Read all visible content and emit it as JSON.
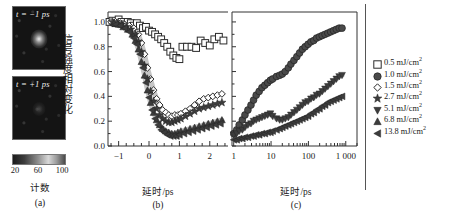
{
  "figure": {
    "panel_a": {
      "label": "(a)",
      "image_top_label": "t = −1 ps",
      "image_bottom_label": "t = +1 ps",
      "colorbar_title": "计数",
      "colorbar_ticks": [
        "20",
        "60",
        "100"
      ],
      "colorbar_min": 20,
      "colorbar_max": 100
    },
    "y_axis_label": "信号强度相对变化",
    "legend_title": "",
    "legend": [
      {
        "marker": "open-square-icon",
        "label": "0.5 mJ/cm",
        "sup": "2",
        "value": 0.5
      },
      {
        "marker": "filled-circle-icon",
        "label": "1.0 mJ/cm",
        "sup": "2",
        "value": 1.0
      },
      {
        "marker": "open-diamond-icon",
        "label": "1.5 mJ/cm",
        "sup": "2",
        "value": 1.5
      },
      {
        "marker": "filled-star-icon",
        "label": "2.7 mJ/cm",
        "sup": "2",
        "value": 2.7
      },
      {
        "marker": "filled-down-triangle-icon",
        "label": "5.1 mJ/cm",
        "sup": "2",
        "value": 5.1
      },
      {
        "marker": "filled-up-triangle-icon",
        "label": "6.8 mJ/cm",
        "sup": "2",
        "value": 6.8
      },
      {
        "marker": "filled-left-triangle-icon",
        "label": "13.8 mJ/cm",
        "sup": "2",
        "value": 13.8
      }
    ]
  },
  "chart_data": [
    {
      "type": "scatter",
      "panel": "(b)",
      "title": "",
      "xlabel": "延时/ps",
      "ylabel": "信号强度相对变化",
      "xscale": "linear",
      "xlim": [
        -1.35,
        2.6
      ],
      "ylim": [
        0.0,
        1.08
      ],
      "xticks": [
        -1,
        0,
        1,
        2
      ],
      "xticklabels": [
        "−1",
        "0",
        "1",
        "2"
      ],
      "yticks": [
        0.0,
        0.2,
        0.4,
        0.6,
        0.8,
        1.0
      ],
      "yticklabels": [
        "0.0",
        "0.2",
        "0.4",
        "0.6",
        "0.8",
        "1.0"
      ],
      "grid": false,
      "legend_position": "right-outside",
      "series": [
        {
          "name": "0.5 mJ/cm2",
          "marker": "open-square-icon",
          "x": [
            -1.3,
            -1.2,
            -1.1,
            -1.0,
            -0.9,
            -0.8,
            -0.7,
            -0.6,
            -0.5,
            -0.4,
            -0.3,
            -0.2,
            -0.1,
            0.0,
            0.1,
            0.2,
            0.3,
            0.4,
            0.5,
            0.6,
            0.7,
            0.8,
            0.9,
            1.0,
            1.1,
            1.25,
            1.4,
            1.55,
            1.7,
            1.85,
            2.0,
            2.15,
            2.3,
            2.45
          ],
          "y": [
            1.0,
            1.01,
            0.99,
            1.02,
            1.0,
            0.98,
            1.0,
            0.99,
            0.97,
            0.99,
            0.97,
            0.95,
            0.96,
            0.93,
            0.92,
            0.9,
            0.88,
            0.86,
            0.83,
            0.8,
            0.76,
            0.73,
            0.71,
            0.7,
            0.8,
            0.8,
            0.8,
            0.79,
            0.85,
            0.83,
            0.81,
            0.86,
            0.88,
            0.85
          ]
        },
        {
          "name": "1.5 mJ/cm2",
          "marker": "open-diamond-icon",
          "x": [
            -1.25,
            -1.1,
            -0.95,
            -0.8,
            -0.65,
            -0.5,
            -0.35,
            -0.25,
            -0.15,
            -0.05,
            0.05,
            0.15,
            0.25,
            0.35,
            0.45,
            0.55,
            0.65,
            0.75,
            0.85,
            0.95,
            1.05,
            1.2,
            1.35,
            1.5,
            1.65,
            1.8,
            1.95,
            2.1,
            2.25,
            2.4
          ],
          "y": [
            1.0,
            1.0,
            0.99,
            0.98,
            0.97,
            0.95,
            0.9,
            0.83,
            0.74,
            0.63,
            0.54,
            0.45,
            0.38,
            0.33,
            0.29,
            0.27,
            0.25,
            0.24,
            0.25,
            0.25,
            0.26,
            0.28,
            0.3,
            0.33,
            0.36,
            0.38,
            0.39,
            0.4,
            0.41,
            0.42
          ]
        },
        {
          "name": "2.7 mJ/cm2",
          "marker": "filled-star-icon",
          "x": [
            -1.2,
            -1.05,
            -0.9,
            -0.75,
            -0.6,
            -0.45,
            -0.35,
            -0.25,
            -0.15,
            -0.05,
            0.05,
            0.15,
            0.25,
            0.35,
            0.45,
            0.55,
            0.65,
            0.75,
            0.85,
            0.95,
            1.05,
            1.2,
            1.35,
            1.5,
            1.65,
            1.8,
            1.95,
            2.1,
            2.25,
            2.4
          ],
          "y": [
            1.0,
            0.99,
            0.98,
            0.96,
            0.94,
            0.9,
            0.84,
            0.76,
            0.65,
            0.54,
            0.44,
            0.36,
            0.3,
            0.25,
            0.22,
            0.2,
            0.19,
            0.19,
            0.2,
            0.21,
            0.22,
            0.24,
            0.26,
            0.28,
            0.3,
            0.31,
            0.32,
            0.33,
            0.34,
            0.35
          ]
        },
        {
          "name": "6.8 mJ/cm2",
          "marker": "filled-up-triangle-icon",
          "x": [
            -1.15,
            -1.0,
            -0.85,
            -0.7,
            -0.55,
            -0.45,
            -0.35,
            -0.25,
            -0.15,
            -0.05,
            0.05,
            0.15,
            0.25,
            0.35,
            0.45,
            0.55,
            0.65,
            0.75,
            0.85,
            0.95,
            1.05,
            1.2,
            1.35,
            1.5,
            1.65,
            1.8,
            1.95,
            2.1,
            2.25,
            2.4
          ],
          "y": [
            0.99,
            0.98,
            0.96,
            0.94,
            0.9,
            0.85,
            0.78,
            0.68,
            0.57,
            0.45,
            0.35,
            0.27,
            0.21,
            0.17,
            0.14,
            0.12,
            0.11,
            0.1,
            0.1,
            0.11,
            0.12,
            0.13,
            0.14,
            0.15,
            0.16,
            0.17,
            0.18,
            0.19,
            0.2,
            0.21
          ]
        },
        {
          "name": "13.8 mJ/cm2",
          "marker": "filled-left-triangle-icon",
          "x": [
            -1.1,
            -0.95,
            -0.8,
            -0.65,
            -0.5,
            -0.4,
            -0.3,
            -0.2,
            -0.1,
            0.0,
            0.1,
            0.2,
            0.3,
            0.4,
            0.5,
            0.6,
            0.7,
            0.8,
            0.9,
            1.0,
            1.15,
            1.3,
            1.45,
            1.6,
            1.75,
            1.9,
            2.05,
            2.2,
            2.35
          ],
          "y": [
            0.98,
            0.97,
            0.95,
            0.92,
            0.87,
            0.82,
            0.74,
            0.63,
            0.51,
            0.39,
            0.29,
            0.22,
            0.17,
            0.13,
            0.11,
            0.09,
            0.08,
            0.08,
            0.08,
            0.09,
            0.1,
            0.11,
            0.12,
            0.13,
            0.14,
            0.15,
            0.16,
            0.17,
            0.18
          ]
        }
      ],
      "fit_curves": [
        {
          "name": "fast-decay-guide-1",
          "note": "grey band through diamond/star decay"
        },
        {
          "name": "fast-decay-guide-2",
          "note": "grey band through triangle decay"
        }
      ]
    },
    {
      "type": "scatter",
      "panel": "(c)",
      "title": "",
      "xlabel": "延时/ps",
      "ylabel": "信号强度相对变化",
      "xscale": "log",
      "xlim": [
        0.9,
        2000
      ],
      "ylim": [
        0.0,
        1.08
      ],
      "xticks": [
        1,
        10,
        100,
        1000
      ],
      "xticklabels": [
        "1",
        "10",
        "100",
        "1 000"
      ],
      "yticks": [
        0.0,
        0.2,
        0.4,
        0.6,
        0.8,
        1.0
      ],
      "grid": false,
      "legend_position": "right-outside",
      "series": [
        {
          "name": "1.0 mJ/cm2",
          "marker": "filled-circle-icon",
          "x": [
            1.0,
            1.2,
            1.4,
            1.7,
            2.0,
            2.4,
            2.9,
            3.4,
            4.0,
            4.8,
            5.7,
            6.8,
            8.1,
            9.6,
            11,
            14,
            17,
            20,
            24,
            29,
            34,
            41,
            49,
            58,
            69,
            82,
            98,
            117,
            139,
            165,
            197,
            234,
            279,
            332,
            395,
            470,
            560,
            667,
            794
          ],
          "y": [
            0.1,
            0.13,
            0.17,
            0.21,
            0.25,
            0.29,
            0.33,
            0.37,
            0.41,
            0.44,
            0.47,
            0.49,
            0.51,
            0.53,
            0.54,
            0.56,
            0.57,
            0.58,
            0.6,
            0.63,
            0.66,
            0.69,
            0.72,
            0.75,
            0.78,
            0.8,
            0.82,
            0.84,
            0.85,
            0.87,
            0.88,
            0.89,
            0.9,
            0.91,
            0.92,
            0.93,
            0.94,
            0.95,
            0.95
          ]
        },
        {
          "name": "5.1 mJ/cm2",
          "marker": "filled-down-triangle-icon",
          "x": [
            1.0,
            1.2,
            1.4,
            1.7,
            2.0,
            2.4,
            2.9,
            3.4,
            4.0,
            4.8,
            5.7,
            6.8,
            8.1,
            9.6,
            11,
            14,
            17,
            20,
            24,
            29,
            34,
            41,
            49,
            58,
            69,
            82,
            98,
            117,
            139,
            165,
            197,
            234,
            279,
            332,
            395,
            470,
            560,
            667,
            794
          ],
          "y": [
            0.09,
            0.1,
            0.12,
            0.13,
            0.15,
            0.17,
            0.18,
            0.2,
            0.21,
            0.22,
            0.23,
            0.24,
            0.25,
            0.26,
            0.24,
            0.22,
            0.21,
            0.21,
            0.22,
            0.23,
            0.25,
            0.27,
            0.29,
            0.31,
            0.33,
            0.35,
            0.36,
            0.38,
            0.39,
            0.41,
            0.42,
            0.44,
            0.46,
            0.48,
            0.5,
            0.52,
            0.54,
            0.56,
            0.57
          ]
        },
        {
          "name": "13.8 mJ/cm2",
          "marker": "filled-left-triangle-icon",
          "x": [
            1.0,
            1.2,
            1.4,
            1.7,
            2.0,
            2.4,
            2.9,
            3.4,
            4.0,
            4.8,
            5.7,
            6.8,
            8.1,
            9.6,
            11,
            14,
            17,
            20,
            24,
            29,
            34,
            41,
            49,
            58,
            69,
            82,
            98,
            117,
            139,
            165,
            197,
            234,
            279,
            332,
            395,
            470,
            560,
            667,
            794
          ],
          "y": [
            0.05,
            0.05,
            0.06,
            0.06,
            0.07,
            0.07,
            0.08,
            0.08,
            0.09,
            0.09,
            0.1,
            0.1,
            0.11,
            0.11,
            0.12,
            0.13,
            0.14,
            0.15,
            0.16,
            0.17,
            0.18,
            0.19,
            0.2,
            0.21,
            0.22,
            0.23,
            0.24,
            0.26,
            0.27,
            0.29,
            0.3,
            0.32,
            0.33,
            0.35,
            0.36,
            0.37,
            0.38,
            0.39,
            0.4
          ]
        }
      ],
      "fit_curves": [
        {
          "name": "recovery-guide-1",
          "note": "grey band through circles"
        },
        {
          "name": "recovery-guide-2",
          "note": "grey band through down-triangles"
        },
        {
          "name": "recovery-guide-3",
          "note": "grey band through left-triangles"
        }
      ]
    }
  ]
}
